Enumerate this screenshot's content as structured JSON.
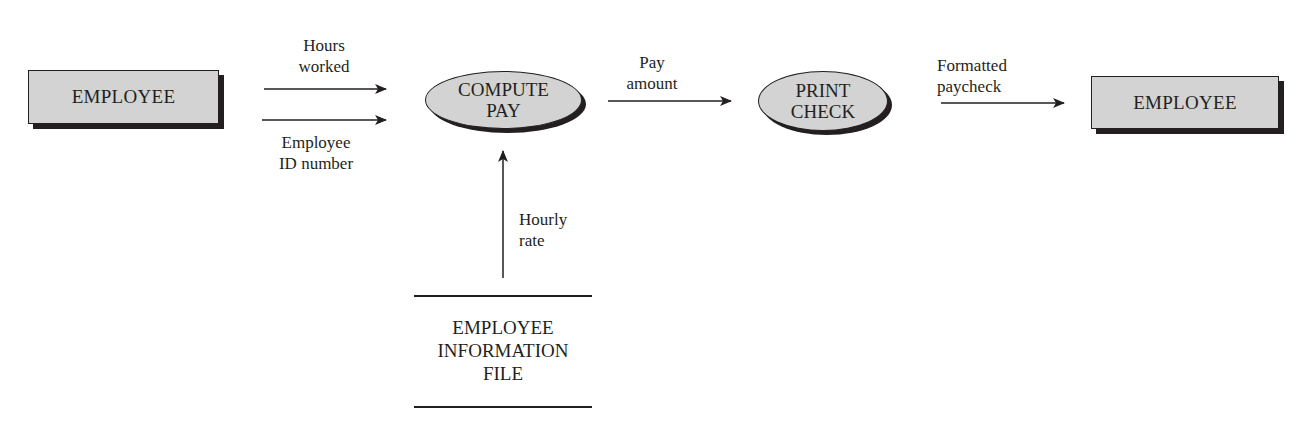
{
  "diagram": {
    "type": "data-flow-diagram",
    "colors": {
      "node_fill": "#d3d3d3",
      "stroke": "#231f20",
      "background": "#ffffff"
    },
    "nodes": {
      "source_entity": {
        "label": "EMPLOYEE",
        "shape": "rectangle"
      },
      "compute_pay": {
        "line1": "COMPUTE",
        "line2": "PAY",
        "shape": "ellipse"
      },
      "print_check": {
        "line1": "PRINT",
        "line2": "CHECK",
        "shape": "ellipse"
      },
      "sink_entity": {
        "label": "EMPLOYEE",
        "shape": "rectangle"
      },
      "data_store": {
        "line1": "EMPLOYEE",
        "line2": "INFORMATION",
        "line3": "FILE",
        "shape": "open-rectangle"
      }
    },
    "flows": {
      "hours_worked": {
        "line1": "Hours",
        "line2": "worked",
        "from": "EMPLOYEE",
        "to": "COMPUTE PAY"
      },
      "employee_id": {
        "line1": "Employee",
        "line2": "ID number",
        "from": "EMPLOYEE",
        "to": "COMPUTE PAY"
      },
      "pay_amount": {
        "line1": "Pay",
        "line2": "amount",
        "from": "COMPUTE PAY",
        "to": "PRINT CHECK"
      },
      "formatted_paycheck": {
        "line1": "Formatted",
        "line2": "paycheck",
        "from": "PRINT CHECK",
        "to": "EMPLOYEE"
      },
      "hourly_rate": {
        "line1": "Hourly",
        "line2": "rate",
        "from": "EMPLOYEE INFORMATION FILE",
        "to": "COMPUTE PAY"
      }
    }
  }
}
